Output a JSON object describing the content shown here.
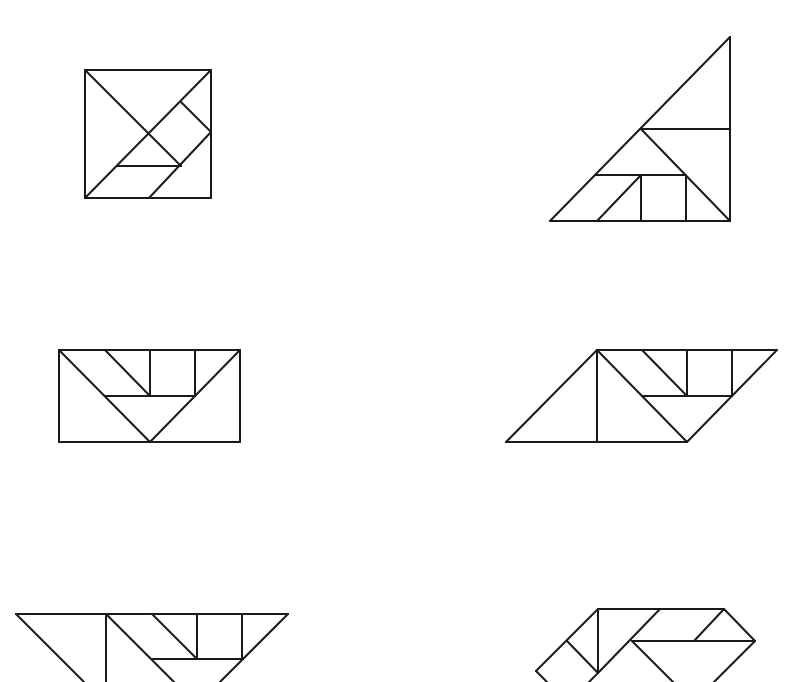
{
  "diagram": {
    "stroke_color": "#1a1a1a",
    "background": "#ffffff",
    "figures": [
      {
        "name": "square",
        "lines": [
          [
            85,
            70,
            211,
            70
          ],
          [
            211,
            70,
            211,
            198
          ],
          [
            211,
            198,
            85,
            198
          ],
          [
            85,
            198,
            85,
            70
          ],
          [
            85,
            70,
            181,
            166
          ],
          [
            211,
            70,
            85,
            198
          ],
          [
            181,
            102,
            211,
            132
          ],
          [
            211,
            132,
            149,
            198
          ],
          [
            117,
            166,
            181,
            166
          ]
        ]
      },
      {
        "name": "large-triangle",
        "lines": [
          [
            730,
            37,
            730,
            221
          ],
          [
            730,
            221,
            550,
            221
          ],
          [
            550,
            221,
            730,
            37
          ],
          [
            641,
            129,
            730,
            129
          ],
          [
            641,
            129,
            730,
            221
          ],
          [
            596,
            175,
            685,
            175
          ],
          [
            641,
            175,
            641,
            221
          ],
          [
            686,
            175,
            686,
            221
          ],
          [
            597,
            221,
            641,
            175
          ]
        ]
      },
      {
        "name": "rectangle",
        "lines": [
          [
            59,
            350,
            240,
            350
          ],
          [
            240,
            350,
            240,
            442
          ],
          [
            240,
            442,
            59,
            442
          ],
          [
            59,
            442,
            59,
            350
          ],
          [
            59,
            350,
            150,
            442
          ],
          [
            240,
            350,
            150,
            442
          ],
          [
            105,
            396,
            195,
            396
          ],
          [
            105,
            350,
            150,
            396
          ],
          [
            150,
            350,
            150,
            396
          ],
          [
            195,
            350,
            195,
            396
          ]
        ]
      },
      {
        "name": "parallelogram",
        "lines": [
          [
            597,
            350,
            777,
            350
          ],
          [
            777,
            350,
            687,
            442
          ],
          [
            687,
            442,
            506,
            442
          ],
          [
            506,
            442,
            597,
            350
          ],
          [
            597,
            350,
            597,
            442
          ],
          [
            597,
            350,
            687,
            442
          ],
          [
            642,
            396,
            732,
            396
          ],
          [
            642,
            350,
            687,
            396
          ],
          [
            687,
            350,
            687,
            396
          ],
          [
            732,
            350,
            732,
            396
          ]
        ]
      },
      {
        "name": "trapezoid-cropped",
        "lines": [
          [
            16,
            614,
            288,
            614
          ],
          [
            16,
            614,
            84,
            682
          ],
          [
            106,
            614,
            106,
            682
          ],
          [
            106,
            614,
            174,
            682
          ],
          [
            152,
            659,
            243,
            659
          ],
          [
            152,
            614,
            197,
            659
          ],
          [
            197,
            614,
            197,
            659
          ],
          [
            242,
            614,
            242,
            659
          ],
          [
            288,
            614,
            220,
            682
          ]
        ]
      },
      {
        "name": "boat-cropped",
        "lines": [
          [
            598,
            609,
            724,
            609
          ],
          [
            598,
            609,
            598,
            673
          ],
          [
            598,
            609,
            536,
            671
          ],
          [
            536,
            671,
            547,
            682
          ],
          [
            567,
            641,
            598,
            673
          ],
          [
            660,
            609,
            598,
            673
          ],
          [
            598,
            673,
            589,
            682
          ],
          [
            632,
            641,
            755,
            641
          ],
          [
            724,
            609,
            694,
            641
          ],
          [
            724,
            609,
            755,
            641
          ],
          [
            755,
            641,
            714,
            682
          ],
          [
            632,
            641,
            673,
            682
          ]
        ]
      }
    ]
  }
}
